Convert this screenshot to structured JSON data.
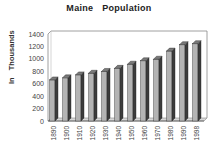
{
  "chart_data": {
    "type": "bar",
    "title": "Maine Population",
    "xlabel": "",
    "ylabel": "In Thousands",
    "categories": [
      "1890",
      "1900",
      "1910",
      "1920",
      "1930",
      "1940",
      "1950",
      "1960",
      "1970",
      "1980",
      "1990",
      "1998"
    ],
    "values": [
      661,
      694,
      742,
      768,
      797,
      847,
      914,
      969,
      994,
      1125,
      1228,
      1244
    ],
    "ylim": [
      0,
      1400
    ],
    "yticks": [
      0,
      200,
      400,
      600,
      800,
      1000,
      1200,
      1400
    ],
    "grid": false,
    "legend": null,
    "style": "3d-column",
    "colors": {
      "front": "#b4b4b4",
      "side": "#3c3c3c",
      "top": "#7a7a7a",
      "frame": "#888888"
    }
  }
}
